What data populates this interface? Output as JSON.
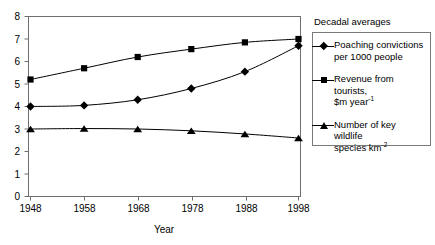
{
  "chart_data": {
    "type": "line",
    "title": "",
    "xlabel": "Year",
    "ylabel": "",
    "x": [
      1948,
      1958,
      1968,
      1978,
      1988,
      1998
    ],
    "xtick_labels": [
      "1948",
      "1958",
      "1968",
      "1978",
      "1988",
      "1998"
    ],
    "ytick_labels": [
      "0",
      "1",
      "2",
      "3",
      "4",
      "5",
      "6",
      "7",
      "8"
    ],
    "xlim": [
      1948,
      1998
    ],
    "ylim": [
      0,
      8
    ],
    "grid": false,
    "legend_position": "right-outside",
    "series": [
      {
        "name": "Poaching convictions per 1000 people",
        "marker": "diamond",
        "values": [
          4.0,
          4.05,
          4.3,
          4.8,
          5.55,
          6.7
        ]
      },
      {
        "name": "Revenue from tourists, $m year",
        "marker": "square",
        "values": [
          5.2,
          5.7,
          6.2,
          6.55,
          6.85,
          7.0
        ]
      },
      {
        "name": "Number of key wildlife species km",
        "marker": "triangle",
        "values": [
          3.0,
          3.02,
          3.0,
          2.92,
          2.78,
          2.6
        ]
      }
    ]
  },
  "axes": {
    "x_title": "Year",
    "x_ticks": [
      "1948",
      "1958",
      "1968",
      "1978",
      "1988",
      "1998"
    ],
    "y_ticks": [
      "8",
      "7",
      "6",
      "5",
      "4",
      "3",
      "2",
      "1",
      "0"
    ]
  },
  "legend": {
    "heading": "Decadal averages",
    "entries": [
      {
        "marker": "diamond",
        "line1": "Poaching convictions",
        "line2": "per 1000 people",
        "superscript": ""
      },
      {
        "marker": "square",
        "line1": "Revenue from tourists,",
        "line2": "$m year",
        "superscript": "-1"
      },
      {
        "marker": "triangle",
        "line1": "Number of key wildlife",
        "line2": "species km",
        "superscript": "-2"
      }
    ]
  },
  "colors": {
    "line": "#000000",
    "marker": "#000000",
    "axis": "#6f6f6f",
    "legend_border": "#7a7a7a",
    "background": "#ffffff"
  }
}
